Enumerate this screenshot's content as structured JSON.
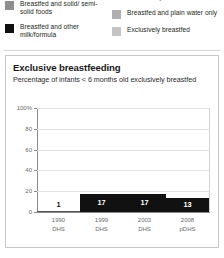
{
  "legend": {
    "left_column": [
      {
        "label": "Breastfed and solid/ semi-solid foods",
        "swatch_color": "#8e8e8e",
        "icon": "legend-swatch-icon"
      },
      {
        "label": "Breastfed and other milk/formula",
        "swatch_color": "#111111",
        "icon": "legend-swatch-icon"
      }
    ],
    "right_column": [
      {
        "label": "non-milk liquids",
        "swatch_color": "#b5b5b5",
        "icon": "legend-swatch-icon"
      },
      {
        "label": "Breastfed and plain water only",
        "swatch_color": "#b0b0b0",
        "icon": "legend-swatch-icon"
      },
      {
        "label": "Exclusively breastfed",
        "swatch_color": "#c4c4c4",
        "icon": "legend-swatch-icon"
      }
    ]
  },
  "card": {
    "title": "Exclusive breastfeeding",
    "subtitle": "Percentage of infants < 6 months old exclusively breastfed"
  },
  "chart_data": {
    "type": "bar",
    "title": "Exclusive breastfeeding",
    "subtitle": "Percentage of infants < 6 months old exclusively breastfed",
    "xlabel": "",
    "ylabel": "",
    "ylim": [
      0,
      100
    ],
    "grid": true,
    "legend_position": "above-chart",
    "bar_color": "#111111",
    "categories": [
      "1990 DHS",
      "1999 DHS",
      "2003 DHS",
      "2008 pDHS"
    ],
    "category_lines": [
      [
        "1990",
        "DHS"
      ],
      [
        "1999",
        "DHS"
      ],
      [
        "2003",
        "DHS"
      ],
      [
        "2008",
        "pDHS"
      ]
    ],
    "values": [
      1,
      17,
      17,
      13
    ],
    "value_labels": [
      "1",
      "17",
      "17",
      "13"
    ],
    "ytick_labels": [
      "100%",
      "80",
      "60",
      "40",
      "20",
      "0"
    ],
    "ytick_values": [
      100,
      80,
      60,
      40,
      20,
      0
    ]
  }
}
